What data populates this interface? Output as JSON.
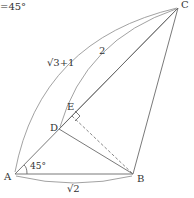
{
  "diagram": {
    "header_text": "=45°",
    "points": {
      "A": {
        "label": "A",
        "x": 15,
        "y": 174
      },
      "B": {
        "label": "B",
        "x": 133,
        "y": 174
      },
      "C": {
        "label": "C",
        "x": 178,
        "y": 8
      },
      "D": {
        "label": "D",
        "x": 59,
        "y": 129
      },
      "E": {
        "label": "E",
        "x": 70,
        "y": 118
      }
    },
    "segments": [
      {
        "from": "A",
        "to": "C",
        "style": "solid"
      },
      {
        "from": "A",
        "to": "B",
        "style": "solid"
      },
      {
        "from": "B",
        "to": "C",
        "style": "solid"
      },
      {
        "from": "D",
        "to": "B",
        "style": "solid"
      },
      {
        "from": "D",
        "to": "C",
        "style": "solid"
      },
      {
        "from": "E",
        "to": "B",
        "style": "dashed"
      }
    ],
    "length_labels": {
      "AC": "√3+1",
      "DC": "2",
      "AB": "√2"
    },
    "angle_label": "45°",
    "right_angle_marker": "E"
  }
}
